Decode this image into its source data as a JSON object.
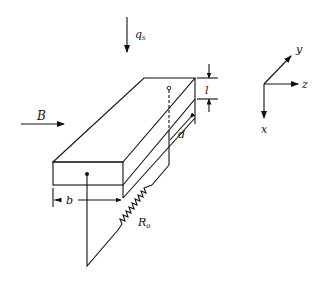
{
  "diagram": {
    "title": "",
    "labels": {
      "heat_flux": "q",
      "heat_flux_sub": "s",
      "magnetic_field": "B",
      "thickness": "l",
      "depth": "d",
      "width": "b",
      "resistor": "R",
      "resistor_sub": "o"
    },
    "axes": {
      "x": "x",
      "y": "y",
      "z": "z"
    },
    "colors": {
      "line": "#111111",
      "background": "#ffffff"
    }
  }
}
